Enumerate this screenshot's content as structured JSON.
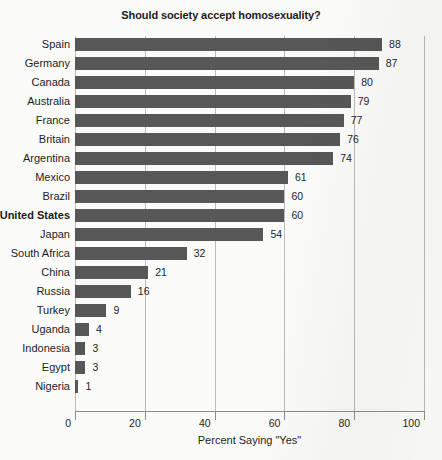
{
  "chart_data": {
    "type": "bar",
    "orientation": "horizontal",
    "title": "Should society accept homosexuality?",
    "xlabel": "Percent Saying \"Yes\"",
    "ylabel": "",
    "xlim": [
      0,
      100
    ],
    "xticks": [
      0,
      20,
      40,
      60,
      80,
      100
    ],
    "xtick_labels": [
      "0",
      "20",
      "40",
      "60",
      "80",
      "100"
    ],
    "grid": true,
    "legend": false,
    "bar_color": "#575757",
    "gridline_color": "#b9b9b9",
    "background_color": "#fbfbfa",
    "categories": [
      "Spain",
      "Germany",
      "Canada",
      "Australia",
      "France",
      "Britain",
      "Argentina",
      "Mexico",
      "Brazil",
      "United States",
      "Japan",
      "South Africa",
      "China",
      "Russia",
      "Turkey",
      "Uganda",
      "Indonesia",
      "Egypt",
      "Nigeria"
    ],
    "values": [
      88,
      87,
      80,
      79,
      77,
      76,
      74,
      61,
      60,
      60,
      54,
      32,
      21,
      16,
      9,
      4,
      3,
      3,
      1
    ],
    "highlighted_categories": [
      "United States"
    ],
    "rows": [
      {
        "label": "Spain",
        "value": 88,
        "value_label": "88",
        "bold": false
      },
      {
        "label": "Germany",
        "value": 87,
        "value_label": "87",
        "bold": false
      },
      {
        "label": "Canada",
        "value": 80,
        "value_label": "80",
        "bold": false
      },
      {
        "label": "Australia",
        "value": 79,
        "value_label": "79",
        "bold": false
      },
      {
        "label": "France",
        "value": 77,
        "value_label": "77",
        "bold": false
      },
      {
        "label": "Britain",
        "value": 76,
        "value_label": "76",
        "bold": false
      },
      {
        "label": "Argentina",
        "value": 74,
        "value_label": "74",
        "bold": false
      },
      {
        "label": "Mexico",
        "value": 61,
        "value_label": "61",
        "bold": false
      },
      {
        "label": "Brazil",
        "value": 60,
        "value_label": "60",
        "bold": false
      },
      {
        "label": "United States",
        "value": 60,
        "value_label": "60",
        "bold": true
      },
      {
        "label": "Japan",
        "value": 54,
        "value_label": "54",
        "bold": false
      },
      {
        "label": "South Africa",
        "value": 32,
        "value_label": "32",
        "bold": false
      },
      {
        "label": "China",
        "value": 21,
        "value_label": "21",
        "bold": false
      },
      {
        "label": "Russia",
        "value": 16,
        "value_label": "16",
        "bold": false
      },
      {
        "label": "Turkey",
        "value": 9,
        "value_label": "9",
        "bold": false
      },
      {
        "label": "Uganda",
        "value": 4,
        "value_label": "4",
        "bold": false
      },
      {
        "label": "Indonesia",
        "value": 3,
        "value_label": "3",
        "bold": false
      },
      {
        "label": "Egypt",
        "value": 3,
        "value_label": "3",
        "bold": false
      },
      {
        "label": "Nigeria",
        "value": 1,
        "value_label": "1",
        "bold": false
      }
    ]
  }
}
